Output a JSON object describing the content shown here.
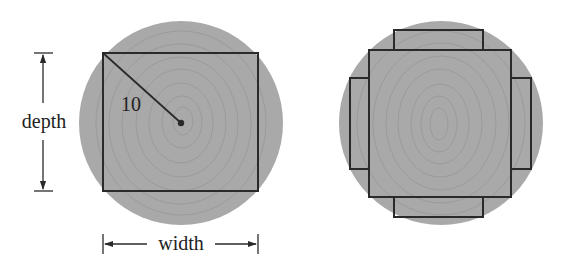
{
  "figure": {
    "left_log": {
      "radius_label": "10",
      "depth_label": "depth",
      "width_label": "width"
    },
    "right_log": {}
  },
  "colors": {
    "wood": "#a9a9a9",
    "ring": "#9a9a9a",
    "line": "#2a2a2a",
    "text": "#222222"
  }
}
